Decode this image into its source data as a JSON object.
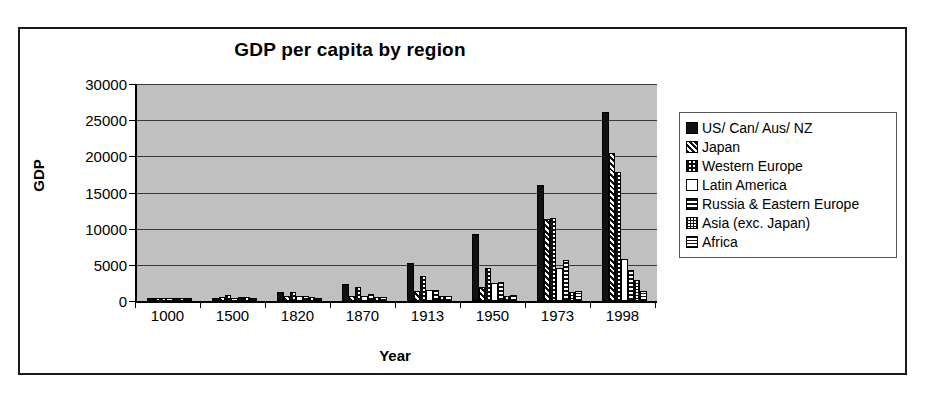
{
  "chart_data": {
    "type": "bar",
    "title": "GDP per capita by region",
    "xlabel": "Year",
    "ylabel": "GDP",
    "categories": [
      "1000",
      "1500",
      "1820",
      "1870",
      "1913",
      "1950",
      "1973",
      "1998"
    ],
    "ylim": [
      0,
      30000
    ],
    "ytick_labels": [
      "30000",
      "25000",
      "20000",
      "15000",
      "10000",
      "5000",
      "0"
    ],
    "ytick_values": [
      30000,
      25000,
      20000,
      15000,
      10000,
      5000,
      0
    ],
    "grid": true,
    "legend_position": "right",
    "plot_background": "#c0c0c0",
    "series": [
      {
        "name": "US/ Can/ Aus/ NZ",
        "pattern": "solid-black",
        "values": [
          400,
          400,
          1200,
          2400,
          5200,
          9300,
          16100,
          26100
        ]
      },
      {
        "name": "Japan",
        "pattern": "diagonal-stripes",
        "values": [
          425,
          500,
          670,
          740,
          1390,
          1920,
          11400,
          20400
        ]
      },
      {
        "name": "Western Europe",
        "pattern": "checkerboard",
        "values": [
          400,
          770,
          1200,
          1960,
          3470,
          4590,
          11500,
          17900
        ]
      },
      {
        "name": "Latin America",
        "pattern": "white",
        "values": [
          400,
          415,
          690,
          680,
          1480,
          2550,
          4530,
          5800
        ]
      },
      {
        "name": "Russia & Eastern Europe",
        "pattern": "horizontal-stripes",
        "values": [
          400,
          490,
          670,
          940,
          1560,
          2600,
          5730,
          4350
        ]
      },
      {
        "name": "Asia (exc. Japan)",
        "pattern": "fine-dots",
        "values": [
          450,
          570,
          575,
          545,
          640,
          635,
          1230,
          2940
        ]
      },
      {
        "name": "Africa",
        "pattern": "horizontal-lines",
        "values": [
          425,
          400,
          420,
          500,
          640,
          890,
          1410,
          1370
        ]
      }
    ]
  },
  "legend": {
    "items": [
      {
        "label": "US/ Can/ Aus/ NZ"
      },
      {
        "label": "Japan"
      },
      {
        "label": "Western Europe"
      },
      {
        "label": "Latin America"
      },
      {
        "label": "Russia & Eastern Europe"
      },
      {
        "label": "Asia (exc. Japan)"
      },
      {
        "label": "Africa"
      }
    ]
  },
  "colors": {
    "ink": "#111111",
    "plot_bg": "#c0c0c0",
    "frame": "#1a1a1a",
    "gridline": "#3a3a3a"
  }
}
